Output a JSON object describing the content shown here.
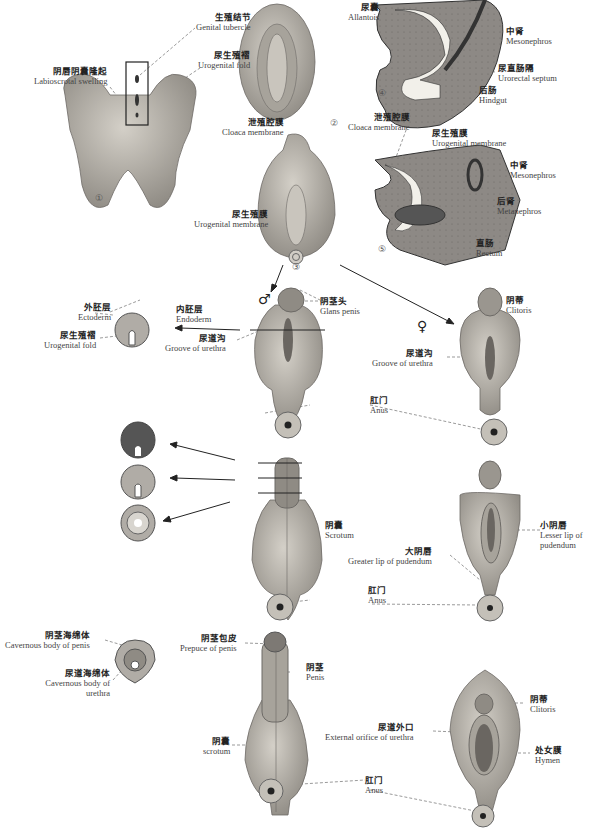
{
  "figure": {
    "stage_numbers": [
      "①",
      "②",
      "③",
      "④",
      "⑤"
    ],
    "sex_symbols": {
      "male": "♂",
      "female": "♀"
    },
    "colors": {
      "tissue": "#b9b4ac",
      "tissue_dark": "#8e8a84",
      "section_fill": "#7d7a76",
      "lumen": "#f2f0ea",
      "line": "#333333"
    }
  },
  "labels": {
    "genital_tubercle": {
      "zh": "生殖结节",
      "en": "Genital tubercle"
    },
    "urogenital_fold_1": {
      "zh": "尿生殖褶",
      "en": "Urogenital fold"
    },
    "labioscrotal_swelling": {
      "zh": "阴唇阴囊隆起",
      "en": "Labioscrotal swelling"
    },
    "cloaca_membrane_2": {
      "zh": "泄殖腔膜",
      "en": "Cloaca membrane"
    },
    "allantois": {
      "zh": "尿囊",
      "en": "Allantois"
    },
    "mesonephros_4": {
      "zh": "中肾",
      "en": "Mesonephros"
    },
    "urorectal_septum": {
      "zh": "尿直肠隔",
      "en": "Urorectal septum"
    },
    "hindgut": {
      "zh": "后肠",
      "en": "Hindgut"
    },
    "cloaca_membrane_4": {
      "zh": "泄殖腔膜",
      "en": "Cloaca membrane"
    },
    "urogenital_membrane_5": {
      "zh": "尿生殖膜",
      "en": "Urogenital membrane"
    },
    "mesonephros_5": {
      "zh": "中肾",
      "en": "Mesonephros"
    },
    "metanephros": {
      "zh": "后肾",
      "en": "Metanephros"
    },
    "rectum": {
      "zh": "直肠",
      "en": "Rectum"
    },
    "urogenital_membrane_3": {
      "zh": "尿生殖膜",
      "en": "Urogenital membrane"
    },
    "glans_penis": {
      "zh": "阴茎头",
      "en": "Glans penis"
    },
    "ectoderm": {
      "zh": "外胚层",
      "en": "Ectoderm"
    },
    "endoderm": {
      "zh": "内胚层",
      "en": "Endoderm"
    },
    "urogenital_fold_x": {
      "zh": "尿生殖褶",
      "en": "Urogenital fold"
    },
    "groove_urethra_m": {
      "zh": "尿道沟",
      "en": "Groove of urethra"
    },
    "anus_m1": {
      "zh": "肛门",
      "en": "Anus"
    },
    "clitoris_f1": {
      "zh": "阴蒂",
      "en": "Clitoris"
    },
    "groove_urethra_f": {
      "zh": "尿道沟",
      "en": "Groove of urethra"
    },
    "scrotum_m2": {
      "zh": "阴囊",
      "en": "Scrotum"
    },
    "anus_m2": {
      "zh": "肛门",
      "en": "Anus"
    },
    "lesser_lip": {
      "zh": "小阴唇",
      "en": "Lesser lip of pudendum"
    },
    "greater_lip": {
      "zh": "大阴唇",
      "en": "Greater lip of pudendum"
    },
    "cavernous_penis": {
      "zh": "阴茎海绵体",
      "en": "Cavernous body of penis"
    },
    "cavernous_urethra": {
      "zh": "尿道海绵体",
      "en": "Cavernous body of urethra"
    },
    "prepuce": {
      "zh": "阴茎包皮",
      "en": "Prepuce of penis"
    },
    "penis": {
      "zh": "阴茎",
      "en": "Penis"
    },
    "scrotum_m3": {
      "zh": "阴囊",
      "en": "scrotum"
    },
    "clitoris_f3": {
      "zh": "阴蒂",
      "en": "Clitoris"
    },
    "ext_orifice": {
      "zh": "尿道外口",
      "en": "External orifice of urethra"
    },
    "hymen": {
      "zh": "处女膜",
      "en": "Hymen"
    },
    "anus_m3": {
      "zh": "肛门",
      "en": "Anus"
    }
  }
}
